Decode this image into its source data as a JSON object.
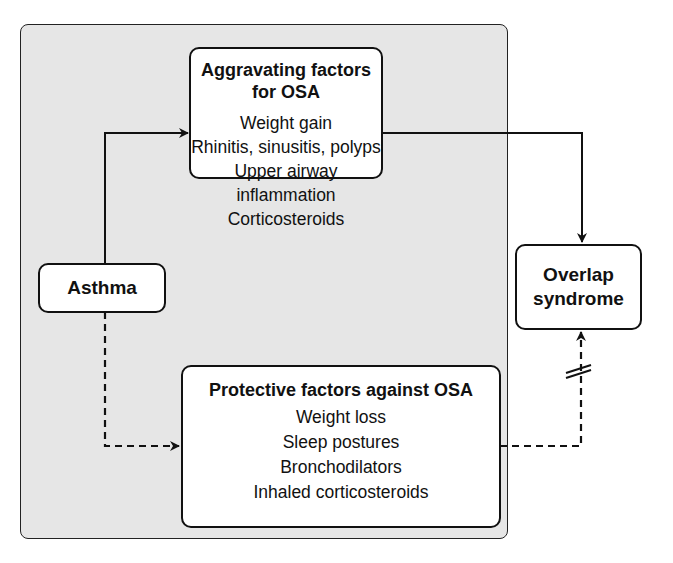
{
  "diagram": {
    "nodes": {
      "asthma": {
        "label": "Asthma"
      },
      "aggravating": {
        "title": "Aggravating factors for OSA",
        "items": [
          "Weight gain",
          "Rhinitis, sinusitis, polyps",
          "Upper airway inflammation",
          "Corticosteroids"
        ]
      },
      "protective": {
        "title": "Protective factors against OSA",
        "items": [
          "Weight loss",
          "Sleep postures",
          "Bronchodilators",
          "Inhaled corticosteroids"
        ]
      },
      "overlap": {
        "line1": "Overlap",
        "line2": "syndrome"
      }
    },
    "edges": [
      {
        "from": "asthma",
        "to": "aggravating",
        "style": "solid"
      },
      {
        "from": "aggravating",
        "to": "overlap",
        "style": "solid"
      },
      {
        "from": "asthma",
        "to": "protective",
        "style": "dashed"
      },
      {
        "from": "protective",
        "to": "overlap",
        "style": "dashed",
        "blocked": true
      }
    ],
    "colors": {
      "background": "#e6e6e6",
      "box_fill": "#ffffff",
      "stroke": "#111111"
    }
  }
}
